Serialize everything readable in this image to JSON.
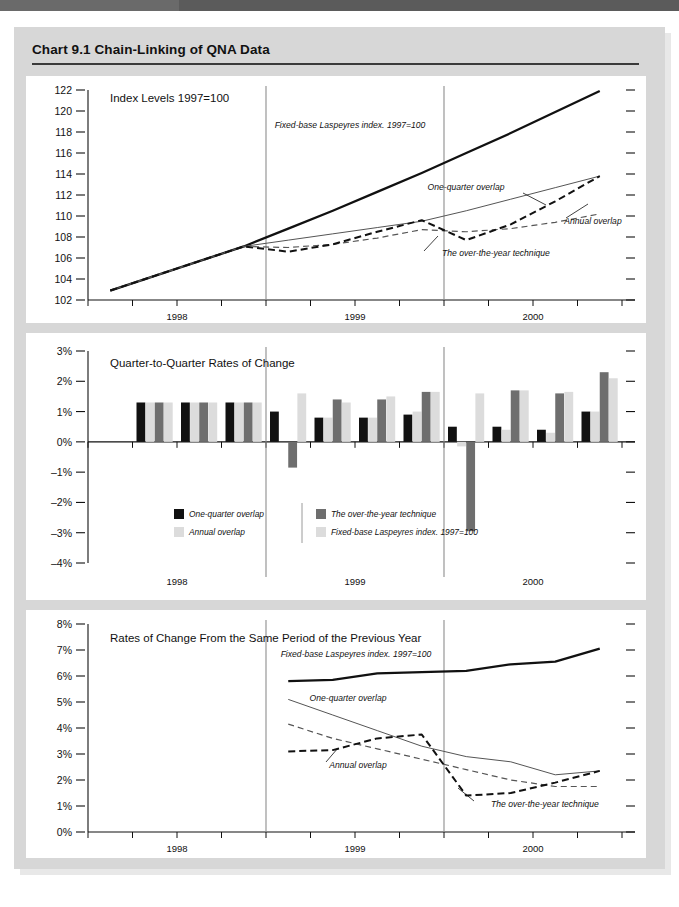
{
  "title": "Chart 9.1  Chain-Linking of QNA Data",
  "colors": {
    "black": "#111111",
    "dark_gray": "#6e6e6e",
    "mid_gray": "#c9c9c9",
    "light_gray": "#dcdcdc",
    "panel_bg": "#ffffff",
    "frame_bg": "#d7d7d7",
    "band": "#5b5b5b"
  },
  "series_names": {
    "one_quarter": "One-quarter overlap",
    "annual": "Annual overlap",
    "over_the_year": "The over-the-year technique",
    "fixed_base": "Fixed-base Laspeyres index. 1997=100"
  },
  "legend": {
    "items": [
      {
        "label": "One-quarter overlap",
        "color": "#111111"
      },
      {
        "label": "The over-the-year technique",
        "color": "#6e6e6e"
      },
      {
        "label": "Annual overlap",
        "color": "#dcdcdc"
      },
      {
        "label": "Fixed-base Laspeyres index. 1997=100",
        "color": "#dcdcdc"
      }
    ]
  },
  "chart_data": [
    {
      "id": "panel1",
      "type": "line",
      "title": "Index Levels 1997=100",
      "xlabel": "",
      "ylabel": "",
      "ylim": [
        102,
        122
      ],
      "yticks": [
        102,
        104,
        106,
        108,
        110,
        112,
        114,
        116,
        118,
        120,
        122
      ],
      "ytick_labels": [
        "102",
        "104",
        "106",
        "108",
        "110",
        "112",
        "114",
        "116",
        "118",
        "120",
        "122"
      ],
      "x": [
        "1998Q1",
        "1998Q2",
        "1998Q3",
        "1998Q4",
        "1999Q1",
        "1999Q2",
        "1999Q3",
        "1999Q4",
        "2000Q1",
        "2000Q2",
        "2000Q3",
        "2000Q4"
      ],
      "xtick_labels": [
        "1998",
        "1999",
        "2000"
      ],
      "grid": false,
      "year_dividers": [
        "1998Q4/1999Q1",
        "1999Q4/2000Q1"
      ],
      "series": [
        {
          "name": "Fixed-base Laspeyres index. 1997=100",
          "style": "solid-thick",
          "color": "#111111",
          "values": [
            102.9,
            104.3,
            105.7,
            107.1,
            108.8,
            110.5,
            112.3,
            114.1,
            116.0,
            117.9,
            119.9,
            121.9
          ]
        },
        {
          "name": "One-quarter overlap",
          "style": "solid-thin",
          "color": "#555555",
          "values": [
            102.9,
            104.3,
            105.7,
            107.1,
            107.7,
            108.3,
            108.9,
            109.5,
            110.5,
            111.6,
            112.7,
            113.8
          ]
        },
        {
          "name": "Annual overlap",
          "style": "dashed-thin",
          "color": "#555555",
          "values": [
            102.9,
            104.3,
            105.7,
            107.1,
            107.0,
            107.3,
            107.9,
            108.7,
            108.5,
            108.8,
            109.4,
            110.2
          ]
        },
        {
          "name": "The over-the-year technique",
          "style": "dashed-thick",
          "color": "#111111",
          "values": [
            102.9,
            104.3,
            105.7,
            107.1,
            106.6,
            107.3,
            108.5,
            109.6,
            107.7,
            109.2,
            111.4,
            113.8
          ]
        }
      ],
      "annotations": [
        {
          "text": "Fixed-base Laspeyres index. 1997=100",
          "anchor": "1999Q1"
        },
        {
          "text": "One-quarter overlap",
          "anchor": "2000Q1"
        },
        {
          "text": "Annual overlap",
          "anchor": "2000Q3"
        },
        {
          "text": "The over-the-year technique",
          "anchor": "2000Q1"
        }
      ]
    },
    {
      "id": "panel2",
      "type": "bar",
      "title": "Quarter-to-Quarter Rates of Change",
      "xlabel": "",
      "ylabel": "",
      "ylim": [
        -4,
        3
      ],
      "yticks": [
        -4,
        -3,
        -2,
        -1,
        0,
        1,
        2,
        3
      ],
      "ytick_labels": [
        "–4%",
        "–3%",
        "–2%",
        "–1%",
        "0%",
        "1%",
        "2%",
        "3%"
      ],
      "categories": [
        "1998Q2",
        "1998Q3",
        "1998Q4",
        "1999Q1",
        "1999Q2",
        "1999Q3",
        "1999Q4",
        "2000Q1",
        "2000Q2",
        "2000Q3",
        "2000Q4"
      ],
      "xtick_labels": [
        "1998",
        "1999",
        "2000"
      ],
      "grid": false,
      "series": [
        {
          "name": "One-quarter overlap",
          "color": "#111111",
          "values": [
            1.3,
            1.3,
            1.3,
            1.0,
            0.8,
            0.8,
            0.9,
            0.5,
            0.5,
            0.4,
            1.0
          ]
        },
        {
          "name": "Annual overlap",
          "color": "#dcdcdc",
          "values": [
            1.3,
            1.3,
            1.3,
            0.0,
            0.8,
            0.8,
            1.0,
            -0.15,
            0.4,
            0.3,
            1.0
          ]
        },
        {
          "name": "The over-the-year technique",
          "color": "#6e6e6e",
          "values": [
            1.3,
            1.3,
            1.3,
            -0.85,
            1.4,
            1.4,
            1.65,
            -2.95,
            1.7,
            1.6,
            2.3
          ]
        },
        {
          "name": "Fixed-base Laspeyres index. 1997=100",
          "color": "#dcdcdc",
          "values": [
            1.3,
            1.3,
            1.3,
            1.6,
            1.3,
            1.5,
            1.65,
            1.6,
            1.7,
            1.65,
            2.1
          ]
        }
      ]
    },
    {
      "id": "panel3",
      "type": "line",
      "title": "Rates of Change From the Same Period of the Previous Year",
      "xlabel": "",
      "ylabel": "",
      "ylim": [
        0,
        8
      ],
      "yticks": [
        0,
        1,
        2,
        3,
        4,
        5,
        6,
        7,
        8
      ],
      "ytick_labels": [
        "0%",
        "1%",
        "2%",
        "3%",
        "4%",
        "5%",
        "6%",
        "7%",
        "8%"
      ],
      "x": [
        "1999Q1",
        "1999Q2",
        "1999Q3",
        "1999Q4",
        "2000Q1",
        "2000Q2",
        "2000Q3",
        "2000Q4"
      ],
      "xtick_labels": [
        "1998",
        "1999",
        "2000"
      ],
      "grid": false,
      "series": [
        {
          "name": "Fixed-base Laspeyres index. 1997=100",
          "style": "solid-thick",
          "color": "#111111",
          "values": [
            5.8,
            5.85,
            6.1,
            6.15,
            6.2,
            6.45,
            6.55,
            7.05
          ]
        },
        {
          "name": "One-quarter overlap",
          "style": "solid-thin",
          "color": "#555555",
          "values": [
            5.1,
            4.5,
            3.9,
            3.3,
            2.9,
            2.7,
            2.2,
            2.35
          ]
        },
        {
          "name": "Annual overlap",
          "style": "dashed-thin",
          "color": "#555555",
          "values": [
            4.15,
            3.6,
            3.2,
            2.8,
            2.4,
            2.0,
            1.75,
            1.75
          ]
        },
        {
          "name": "The over-the-year technique",
          "style": "dashed-thick",
          "color": "#111111",
          "values": [
            3.1,
            3.15,
            3.6,
            3.75,
            1.4,
            1.5,
            1.9,
            2.35
          ]
        }
      ],
      "annotations": [
        {
          "text": "Fixed-base Laspeyres index. 1997=100",
          "anchor": "1999Q2"
        },
        {
          "text": "One-quarter overlap",
          "anchor": "1999Q2"
        },
        {
          "text": "Annual overlap",
          "anchor": "1999Q3"
        },
        {
          "text": "The over-the-year technique",
          "anchor": "2000Q2"
        }
      ]
    }
  ]
}
